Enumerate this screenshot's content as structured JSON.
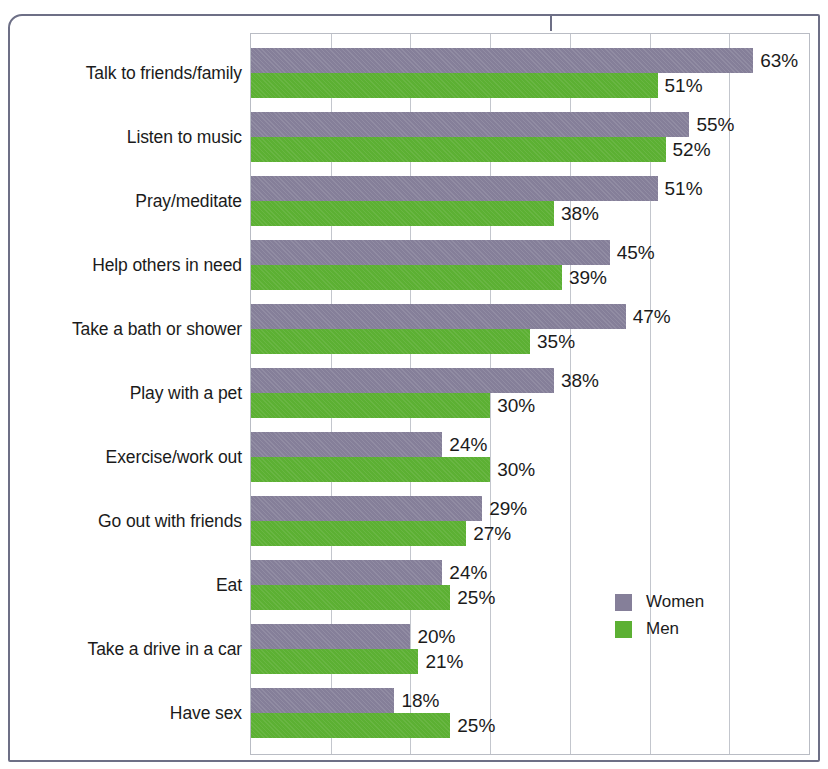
{
  "chart_data": {
    "type": "bar",
    "orientation": "horizontal",
    "title": "",
    "subtitle": "",
    "xlabel": "",
    "ylabel": "",
    "xlim": [
      0,
      70
    ],
    "grid": true,
    "gridline_interval": 10,
    "legend_position": "inside-bottom-right",
    "value_suffix": "%",
    "categories": [
      "Talk to friends/family",
      "Listen to music",
      "Pray/meditate",
      "Help others in need",
      "Take a bath or shower",
      "Play with a pet",
      "Exercise/work out",
      "Go out with friends",
      "Eat",
      "Take a drive in a car",
      "Have sex"
    ],
    "series": [
      {
        "name": "Women",
        "color": "#857f99",
        "values": [
          63,
          55,
          51,
          45,
          47,
          38,
          24,
          29,
          24,
          20,
          18
        ],
        "labels": [
          "63%",
          "55%",
          "51%",
          "45%",
          "47%",
          "38%",
          "24%",
          "29%",
          "24%",
          "20%",
          "18%"
        ]
      },
      {
        "name": "Men",
        "color": "#5cb033",
        "values": [
          51,
          52,
          38,
          39,
          35,
          30,
          30,
          27,
          25,
          21,
          25
        ],
        "labels": [
          "51%",
          "52%",
          "38%",
          "39%",
          "35%",
          "30%",
          "30%",
          "27%",
          "25%",
          "21%",
          "25%"
        ]
      }
    ]
  },
  "legend": {
    "items": [
      {
        "label": "Women",
        "color": "#857f99"
      },
      {
        "label": "Men",
        "color": "#5cb033"
      }
    ]
  },
  "colors": {
    "women": "#857f99",
    "men": "#5cb033",
    "gridline": "#c3c6cd",
    "plot_border": "#b9bcc4",
    "page_border": "#6d6f86",
    "text": "#1b1b1b"
  }
}
